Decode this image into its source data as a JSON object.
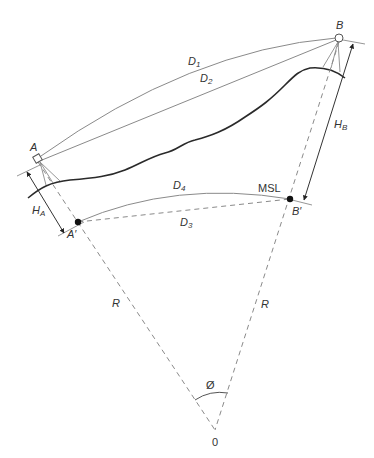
{
  "diagram": {
    "type": "geodetic-distance-reduction",
    "colors": {
      "line": "#8a8a8a",
      "ground": "#2a2a2a",
      "text": "#333333",
      "dot": "#111111"
    },
    "points": {
      "A": {
        "label": "A"
      },
      "A_prime": {
        "label": "A′"
      },
      "B": {
        "label": "B"
      },
      "B_prime": {
        "label": "B′"
      },
      "center": {
        "label": "0"
      }
    },
    "distances": {
      "D1": {
        "base": "D",
        "sub": "1"
      },
      "D2": {
        "base": "D",
        "sub": "2"
      },
      "D3": {
        "base": "D",
        "sub": "3"
      },
      "D4": {
        "base": "D",
        "sub": "4"
      }
    },
    "heights": {
      "HA": {
        "base": "H",
        "sub": "A"
      },
      "HB": {
        "base": "H",
        "sub": "B"
      }
    },
    "radius_left": "R",
    "radius_right": "R",
    "angle": "Ø",
    "msl": "MSL"
  }
}
